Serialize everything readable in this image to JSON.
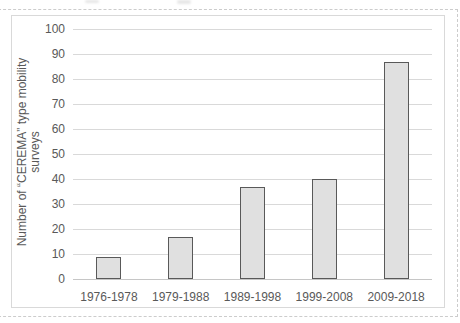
{
  "chart_data": {
    "type": "bar",
    "categories": [
      "1976-1978",
      "1979-1988",
      "1989-1998",
      "1999-2008",
      "2009-2018"
    ],
    "values": [
      9,
      17,
      37,
      40,
      87
    ],
    "ylabel": "Number of “CEREMA” type mobility surveys",
    "ylabel_lines": [
      "Number of “CEREMA” type mobility",
      "surveys"
    ],
    "yticks": [
      0,
      10,
      20,
      30,
      40,
      50,
      60,
      70,
      80,
      90,
      100
    ],
    "ylim": [
      0,
      100
    ],
    "grid": true,
    "legend": "none",
    "colors": {
      "background": "#ffffff",
      "bar_fill": "#e0e0e0",
      "bar_border": "#595959",
      "gridline": "#d9d9d9",
      "axis_line": "#c6c6c6",
      "tick_label": "#595959",
      "chart_border": "#d9d9d9",
      "dashed_frame": "#cccccc"
    }
  }
}
